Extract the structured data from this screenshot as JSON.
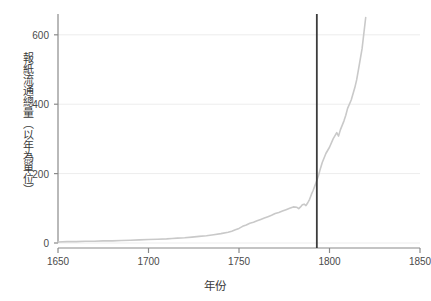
{
  "chart_data": {
    "type": "line",
    "title": "",
    "xlabel": "年份",
    "ylabel": "報紙流通總量（以年為單位）",
    "xlim": [
      1650,
      1850
    ],
    "ylim": [
      0,
      660
    ],
    "xticks": [
      1650,
      1700,
      1750,
      1800,
      1850
    ],
    "xticklabels": [
      "1650",
      "1700",
      "1750",
      "1800",
      "1850"
    ],
    "yticks": [
      0,
      200,
      400,
      600
    ],
    "yticklabels": [
      "0",
      "200",
      "400",
      "600"
    ],
    "grid": "horizontal",
    "legend": "none",
    "line_color": "#c9c9c9",
    "axis_color": "#8a8a8a",
    "grid_color": "#ededed",
    "annotation_line": {
      "name": "vertical-reference-line",
      "x": 1793,
      "color": "#3c3c3c",
      "y_top": 660,
      "y_bottom": 0
    },
    "series": [
      {
        "name": "報紙流通總量",
        "x": [
          1650,
          1655,
          1660,
          1665,
          1670,
          1675,
          1680,
          1685,
          1690,
          1695,
          1700,
          1705,
          1710,
          1713,
          1716,
          1720,
          1724,
          1728,
          1732,
          1736,
          1740,
          1744,
          1746,
          1748,
          1750,
          1752,
          1754,
          1756,
          1758,
          1760,
          1762,
          1764,
          1766,
          1768,
          1770,
          1772,
          1774,
          1776,
          1778,
          1780,
          1782,
          1783,
          1784,
          1785,
          1786,
          1787,
          1788,
          1789,
          1790,
          1791,
          1792,
          1793,
          1794,
          1795,
          1796,
          1798,
          1800,
          1802,
          1804,
          1805,
          1806,
          1808,
          1809,
          1810,
          1812,
          1814,
          1815,
          1816,
          1818,
          1820
        ],
        "y": [
          3,
          4,
          4,
          5,
          5,
          6,
          6,
          7,
          8,
          9,
          10,
          11,
          12,
          13,
          14,
          15,
          17,
          19,
          21,
          24,
          27,
          31,
          34,
          38,
          42,
          48,
          52,
          57,
          60,
          64,
          68,
          72,
          76,
          80,
          85,
          88,
          92,
          96,
          100,
          104,
          103,
          99,
          104,
          110,
          112,
          108,
          116,
          126,
          140,
          152,
          166,
          180,
          196,
          215,
          232,
          258,
          276,
          300,
          318,
          308,
          326,
          352,
          368,
          388,
          412,
          448,
          470,
          500,
          560,
          650
        ]
      }
    ]
  }
}
